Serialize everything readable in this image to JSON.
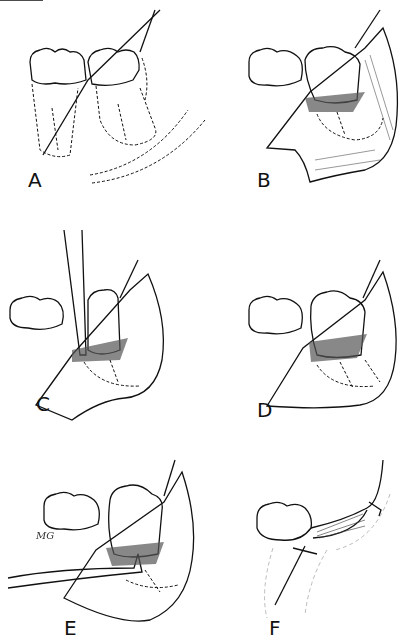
{
  "figure": {
    "ink_color": "#111111",
    "shade_color": "#555555",
    "panels": [
      {
        "id": "A",
        "label": "A",
        "content": "Two molar crowns with dashed root outlines, incision line and dashed flap outline"
      },
      {
        "id": "B",
        "label": "B",
        "content": "Mucoperiosteal flap reflected exposing bone around molar"
      },
      {
        "id": "C",
        "label": "C",
        "content": "Elevator inserted vertically beside molar"
      },
      {
        "id": "D",
        "label": "D",
        "content": "Bone removed around molar, roots shown dashed"
      },
      {
        "id": "E",
        "label": "E",
        "content": "Elevator applied horizontally at furcation"
      },
      {
        "id": "F",
        "label": "F",
        "content": "Flap sutured back after extraction"
      }
    ],
    "signature": "MG"
  }
}
